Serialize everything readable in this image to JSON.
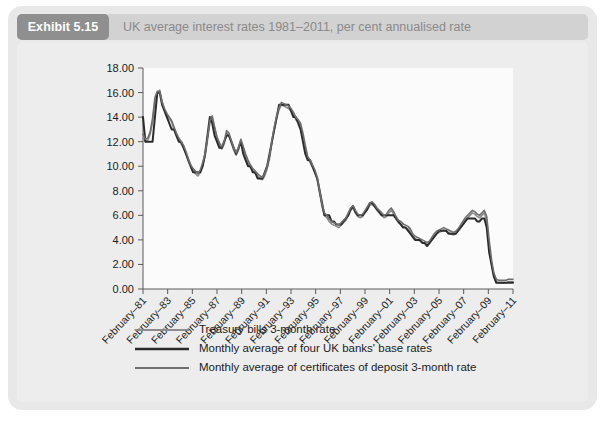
{
  "exhibit": {
    "badge": "Exhibit 5.15",
    "title": "UK average interest rates 1981–2011, per cent annualised rate"
  },
  "colors": {
    "card_bg": "#e8e8e8",
    "header_bar": "#d2d2d2",
    "badge_bg": "#8f8f8f",
    "title_text": "#8a8a8a",
    "plot_bg": "#fbfbfb",
    "axis": "#5a5a5a",
    "series_treasury": "#8c8c8c",
    "series_base": "#2b2b2b",
    "series_cd": "#6e6e6e"
  },
  "chart_data": {
    "type": "line",
    "title": "UK average interest rates 1981–2011, per cent annualised rate",
    "xlabel": "",
    "ylabel": "",
    "ylim": [
      0,
      18
    ],
    "ytick_step": 2,
    "grid": false,
    "legend_position": "bottom",
    "ytick_labels": [
      "0.00",
      "2.00",
      "4.00",
      "6.00",
      "8.00",
      "10.00",
      "12.00",
      "14.00",
      "16.00",
      "18.00"
    ],
    "ytick_values": [
      0,
      2,
      4,
      6,
      8,
      10,
      12,
      14,
      16,
      18
    ],
    "xtick_labels": [
      "February–81",
      "February–83",
      "February–85",
      "February–87",
      "February–89",
      "February–91",
      "February–93",
      "February–95",
      "February–97",
      "February–99",
      "February–01",
      "February–03",
      "February–05",
      "February–07",
      "February–09",
      "February–11"
    ],
    "x_start_year": 1981,
    "x_end_year": 2011,
    "x_step_years": 2,
    "series": [
      {
        "name": "Treasury bills 3-month rate",
        "color": "#8c8c8c",
        "width": 1.6,
        "values": [
          12.3,
          12.0,
          12.1,
          12.6,
          13.6,
          15.3,
          15.9,
          16.2,
          15.3,
          14.6,
          14.2,
          13.9,
          13.6,
          13.0,
          12.5,
          12.1,
          11.8,
          11.5,
          11.0,
          10.4,
          9.9,
          9.6,
          9.4,
          9.2,
          9.5,
          10.1,
          10.8,
          12.1,
          13.5,
          14.0,
          13.1,
          12.2,
          11.7,
          11.4,
          11.8,
          12.7,
          12.5,
          11.9,
          11.3,
          10.9,
          11.3,
          12.0,
          11.5,
          10.8,
          10.3,
          9.9,
          9.6,
          9.4,
          9.2,
          9.0,
          8.9,
          9.2,
          9.8,
          10.6,
          11.9,
          13.0,
          13.9,
          14.6,
          15.0,
          14.9,
          14.8,
          14.7,
          14.5,
          14.2,
          13.8,
          13.6,
          13.3,
          12.5,
          11.5,
          10.6,
          10.3,
          9.9,
          9.5,
          8.9,
          7.8,
          6.7,
          6.0,
          5.8,
          5.5,
          5.3,
          5.2,
          5.1,
          5.0,
          5.2,
          5.4,
          5.6,
          6.0,
          6.4,
          6.6,
          6.2,
          5.9,
          5.8,
          5.9,
          6.2,
          6.5,
          6.8,
          6.9,
          6.7,
          6.4,
          6.2,
          6.0,
          5.8,
          5.9,
          6.2,
          6.4,
          6.1,
          5.7,
          5.4,
          5.3,
          5.1,
          5.0,
          4.9,
          4.7,
          4.3,
          4.1,
          4.0,
          3.9,
          3.8,
          3.7,
          3.6,
          3.7,
          4.0,
          4.3,
          4.5,
          4.6,
          4.7,
          4.8,
          4.7,
          4.6,
          4.5,
          4.4,
          4.5,
          4.7,
          5.0,
          5.3,
          5.6,
          5.8,
          6.0,
          6.2,
          6.1,
          5.9,
          5.8,
          6.0,
          6.2,
          5.5,
          3.5,
          2.0,
          1.0,
          0.6,
          0.5,
          0.5,
          0.5,
          0.5,
          0.6,
          0.6,
          0.6
        ]
      },
      {
        "name": "Monthly average of four UK banks' base rates",
        "color": "#2b2b2b",
        "width": 2.0,
        "values": [
          14.0,
          12.0,
          12.0,
          12.0,
          12.0,
          14.0,
          16.0,
          16.0,
          15.0,
          14.5,
          14.0,
          13.5,
          13.0,
          13.0,
          12.5,
          12.0,
          12.0,
          11.5,
          11.0,
          10.5,
          10.0,
          9.5,
          9.5,
          9.5,
          9.5,
          10.0,
          11.0,
          12.5,
          14.0,
          13.5,
          12.5,
          12.0,
          11.5,
          11.5,
          12.0,
          12.5,
          12.5,
          12.0,
          11.5,
          11.0,
          11.5,
          12.0,
          11.0,
          10.5,
          10.0,
          10.0,
          9.5,
          9.5,
          9.0,
          9.0,
          9.0,
          9.5,
          10.0,
          11.0,
          12.0,
          13.0,
          14.0,
          15.0,
          15.0,
          15.0,
          15.0,
          15.0,
          14.5,
          14.0,
          14.0,
          13.5,
          13.0,
          12.0,
          11.0,
          10.5,
          10.5,
          10.0,
          9.5,
          9.0,
          8.0,
          7.0,
          6.0,
          6.0,
          6.0,
          5.5,
          5.5,
          5.25,
          5.25,
          5.25,
          5.5,
          5.75,
          6.0,
          6.5,
          6.75,
          6.25,
          6.0,
          6.0,
          6.0,
          6.25,
          6.5,
          7.0,
          7.0,
          6.75,
          6.5,
          6.25,
          6.0,
          6.0,
          6.0,
          6.0,
          6.0,
          6.0,
          5.75,
          5.5,
          5.25,
          5.0,
          5.0,
          4.75,
          4.5,
          4.25,
          4.0,
          4.0,
          4.0,
          3.75,
          3.75,
          3.5,
          3.75,
          4.0,
          4.25,
          4.5,
          4.75,
          4.75,
          4.75,
          4.75,
          4.5,
          4.5,
          4.5,
          4.5,
          4.75,
          5.0,
          5.25,
          5.5,
          5.75,
          5.75,
          5.75,
          5.75,
          5.5,
          5.5,
          5.75,
          5.75,
          5.0,
          3.0,
          2.0,
          1.0,
          0.5,
          0.5,
          0.5,
          0.5,
          0.5,
          0.5,
          0.5,
          0.5
        ]
      },
      {
        "name": "Monthly average of certificates of deposit 3-month rate",
        "color": "#6e6e6e",
        "width": 1.6,
        "values": [
          12.6,
          12.2,
          12.3,
          12.8,
          13.9,
          15.6,
          16.1,
          16.1,
          15.2,
          14.7,
          14.3,
          14.0,
          13.7,
          13.2,
          12.7,
          12.3,
          12.0,
          11.7,
          11.2,
          10.6,
          10.1,
          9.8,
          9.6,
          9.4,
          9.7,
          10.3,
          11.0,
          12.3,
          13.7,
          14.1,
          13.2,
          12.4,
          11.9,
          11.6,
          12.0,
          12.9,
          12.7,
          12.1,
          11.5,
          11.1,
          11.5,
          12.2,
          11.6,
          11.0,
          10.5,
          10.1,
          9.8,
          9.6,
          9.4,
          9.2,
          9.1,
          9.4,
          10.0,
          10.8,
          12.1,
          13.2,
          14.1,
          14.8,
          15.2,
          15.1,
          15.0,
          14.9,
          14.7,
          14.4,
          14.0,
          13.8,
          13.5,
          12.7,
          11.7,
          10.8,
          10.5,
          10.1,
          9.7,
          9.1,
          8.0,
          6.9,
          6.2,
          6.0,
          5.7,
          5.5,
          5.4,
          5.3,
          5.2,
          5.4,
          5.6,
          5.8,
          6.2,
          6.6,
          6.8,
          6.4,
          6.1,
          6.0,
          6.1,
          6.4,
          6.7,
          7.0,
          7.1,
          6.9,
          6.6,
          6.4,
          6.2,
          6.0,
          6.1,
          6.4,
          6.6,
          6.3,
          5.9,
          5.6,
          5.5,
          5.3,
          5.2,
          5.1,
          4.9,
          4.5,
          4.3,
          4.2,
          4.1,
          4.0,
          3.9,
          3.8,
          3.9,
          4.2,
          4.5,
          4.7,
          4.8,
          4.9,
          5.0,
          4.9,
          4.8,
          4.7,
          4.6,
          4.7,
          4.9,
          5.2,
          5.5,
          5.8,
          6.0,
          6.2,
          6.4,
          6.3,
          6.1,
          6.0,
          6.2,
          6.4,
          5.9,
          4.0,
          2.4,
          1.3,
          0.8,
          0.7,
          0.7,
          0.7,
          0.7,
          0.8,
          0.8,
          0.8
        ]
      }
    ]
  }
}
